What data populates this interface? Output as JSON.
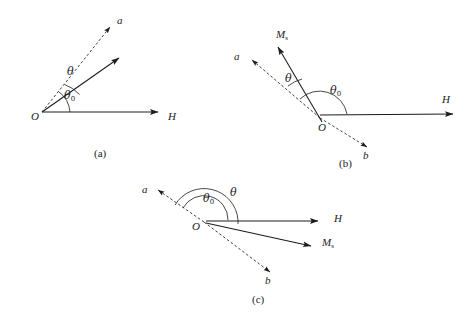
{
  "figure": {
    "type": "vector-diagram",
    "background_color": "#ffffff",
    "stroke_color": "#1c1c1c"
  },
  "panels": [
    {
      "id": "a",
      "caption": "(a)",
      "caption_pos": {
        "x": 94,
        "y": 150
      },
      "origin": {
        "x": 42,
        "y": 112
      },
      "origin_label": "O",
      "origin_label_pos": {
        "x": 31,
        "y": 115
      },
      "vectors": [
        {
          "name": "easy-axis-a",
          "label": "a",
          "label_pos": {
            "x": 117,
            "y": 19
          },
          "style": "dashed",
          "from": {
            "x": 42,
            "y": 112
          },
          "to": {
            "x": 112,
            "y": 25
          }
        },
        {
          "name": "magnetization",
          "label": "",
          "label_pos": {
            "x": 0,
            "y": 0
          },
          "style": "solid",
          "from": {
            "x": 42,
            "y": 112
          },
          "to": {
            "x": 121,
            "y": 57
          }
        },
        {
          "name": "field-H",
          "label": "H",
          "label_pos": {
            "x": 168,
            "y": 115
          },
          "style": "solid",
          "from": {
            "x": 42,
            "y": 112
          },
          "to": {
            "x": 160,
            "y": 112
          }
        }
      ],
      "angles": [
        {
          "name": "theta",
          "label": "θ",
          "sub": "",
          "label_pos": {
            "x": 67,
            "y": 70
          }
        },
        {
          "name": "theta-zero",
          "label": "θ",
          "sub": "0",
          "label_pos": {
            "x": 65,
            "y": 94
          }
        }
      ]
    },
    {
      "id": "b",
      "caption": "(b)",
      "caption_pos": {
        "x": 339,
        "y": 160
      },
      "origin": {
        "x": 320,
        "y": 118
      },
      "origin_label": "O",
      "origin_label_pos": {
        "x": 317,
        "y": 125
      },
      "vectors": [
        {
          "name": "easy-axis-a",
          "label": "a",
          "label_pos": {
            "x": 234,
            "y": 54
          },
          "style": "dashed",
          "from": {
            "x": 320,
            "y": 118
          },
          "to": {
            "x": 250,
            "y": 58
          }
        },
        {
          "name": "easy-axis-b",
          "label": "b",
          "label_pos": {
            "x": 362,
            "y": 155
          },
          "style": "dashed",
          "from": {
            "x": 320,
            "y": 118
          },
          "to": {
            "x": 369,
            "y": 149
          }
        },
        {
          "name": "magnetization",
          "label": "M",
          "sub": "s",
          "label_pos": {
            "x": 278,
            "y": 34
          },
          "style": "solid",
          "from": {
            "x": 320,
            "y": 118
          },
          "to": {
            "x": 276,
            "y": 45
          }
        },
        {
          "name": "field-H",
          "label": "H",
          "label_pos": {
            "x": 442,
            "y": 97
          },
          "style": "solid",
          "from": {
            "x": 320,
            "y": 118
          },
          "to": {
            "x": 455,
            "y": 114
          }
        }
      ],
      "angles": [
        {
          "name": "theta",
          "label": "θ",
          "sub": "",
          "label_pos": {
            "x": 285,
            "y": 77
          }
        },
        {
          "name": "theta-zero",
          "label": "θ",
          "sub": "0",
          "label_pos": {
            "x": 331,
            "y": 89
          }
        }
      ]
    },
    {
      "id": "c",
      "caption": "(c)",
      "caption_pos": {
        "x": 252,
        "y": 296
      },
      "origin": {
        "x": 204,
        "y": 222
      },
      "origin_label": "O",
      "origin_label_pos": {
        "x": 192,
        "y": 225
      },
      "vectors": [
        {
          "name": "easy-axis-a",
          "label": "a",
          "label_pos": {
            "x": 142,
            "y": 187
          },
          "style": "dashed",
          "from": {
            "x": 204,
            "y": 222
          },
          "to": {
            "x": 156,
            "y": 189
          }
        },
        {
          "name": "easy-axis-b",
          "label": "b",
          "label_pos": {
            "x": 265,
            "y": 280
          },
          "style": "dashed",
          "from": {
            "x": 204,
            "y": 222
          },
          "to": {
            "x": 272,
            "y": 274
          }
        },
        {
          "name": "magnetization",
          "label": "M",
          "sub": "s",
          "label_pos": {
            "x": 322,
            "y": 240
          },
          "style": "solid",
          "from": {
            "x": 204,
            "y": 222
          },
          "to": {
            "x": 313,
            "y": 246
          }
        },
        {
          "name": "field-H",
          "label": "H",
          "label_pos": {
            "x": 334,
            "y": 216
          },
          "style": "solid",
          "from": {
            "x": 204,
            "y": 222
          },
          "to": {
            "x": 320,
            "y": 221
          }
        }
      ],
      "angles": [
        {
          "name": "theta",
          "label": "θ",
          "sub": "",
          "label_pos": {
            "x": 231,
            "y": 191
          }
        },
        {
          "name": "theta-zero",
          "label": "θ",
          "sub": "0",
          "label_pos": {
            "x": 204,
            "y": 196
          }
        }
      ]
    }
  ]
}
